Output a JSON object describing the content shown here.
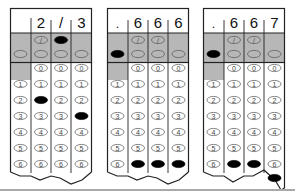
{
  "colors": {
    "shade": "#b7b7b7",
    "line": "#222222",
    "filled": "#000000",
    "bubble_stroke": "#555555",
    "rule": "#a9a9a9"
  },
  "bubble_rows": [
    "0",
    "1",
    "2",
    "3",
    "4",
    "5",
    "6"
  ],
  "fraction_row_label": "/",
  "decimal_row_label": ".",
  "grids": [
    {
      "id": "grid-1",
      "answer": "2/3",
      "header": [
        "",
        "2",
        "/",
        "3"
      ],
      "fraction_filled": [
        false,
        false,
        true,
        false
      ],
      "decimal_filled": [
        false,
        false,
        false,
        false
      ],
      "digits_filled": [
        null,
        "2",
        null,
        "3"
      ]
    },
    {
      "id": "grid-2",
      "answer": ".666",
      "header": [
        ".",
        "6",
        "6",
        "6"
      ],
      "fraction_filled": [
        false,
        false,
        false,
        false
      ],
      "decimal_filled": [
        true,
        false,
        false,
        false
      ],
      "digits_filled": [
        null,
        "6",
        "6",
        "6"
      ]
    },
    {
      "id": "grid-3",
      "answer": ".667",
      "header": [
        ".",
        "6",
        "6",
        "7"
      ],
      "fraction_filled": [
        false,
        false,
        false,
        false
      ],
      "decimal_filled": [
        true,
        false,
        false,
        false
      ],
      "digits_filled": [
        null,
        "6",
        "6",
        "7"
      ]
    }
  ]
}
